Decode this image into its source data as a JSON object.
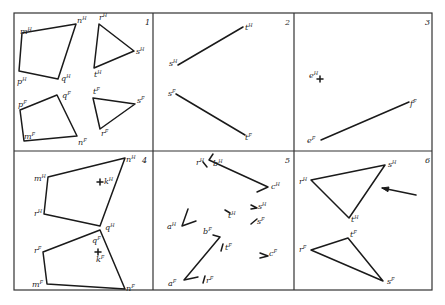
{
  "figure": {
    "grid": {
      "rows": 2,
      "cols": 3
    },
    "panels": [
      {
        "number": "1",
        "polygons": [
          {
            "name": "quad-horizontal",
            "points": [
              [
                22,
                33
              ],
              [
                76,
                24
              ],
              [
                58,
                79
              ],
              [
                19,
                71
              ]
            ],
            "labels": [
              {
                "t": "m",
                "s": "H",
                "x": 20,
                "y": 34
              },
              {
                "t": "n",
                "s": "H",
                "x": 77,
                "y": 23
              },
              {
                "t": "q",
                "s": "H",
                "x": 61,
                "y": 81
              },
              {
                "t": "p",
                "s": "H",
                "x": 17,
                "y": 84
              }
            ]
          },
          {
            "name": "tri-horizontal",
            "points": [
              [
                99,
                24
              ],
              [
                134,
                51
              ],
              [
                94,
                68
              ]
            ],
            "labels": [
              {
                "t": "r",
                "s": "H",
                "x": 99,
                "y": 20
              },
              {
                "t": "s",
                "s": "H",
                "x": 136,
                "y": 54
              },
              {
                "t": "t",
                "s": "H",
                "x": 94,
                "y": 77
              }
            ]
          },
          {
            "name": "quad-frontal",
            "points": [
              [
                20,
                110
              ],
              [
                57,
                95
              ],
              [
                77,
                136
              ],
              [
                24,
                141
              ]
            ],
            "labels": [
              {
                "t": "p",
                "s": "F",
                "x": 18,
                "y": 107
              },
              {
                "t": "q",
                "s": "F",
                "x": 62,
                "y": 98
              },
              {
                "t": "n",
                "s": "F",
                "x": 78,
                "y": 145
              },
              {
                "t": "m",
                "s": "F",
                "x": 24,
                "y": 139
              }
            ]
          },
          {
            "name": "tri-frontal",
            "points": [
              [
                93,
                98
              ],
              [
                135,
                104
              ],
              [
                100,
                129
              ]
            ],
            "labels": [
              {
                "t": "t",
                "s": "F",
                "x": 93,
                "y": 94
              },
              {
                "t": "s",
                "s": "F",
                "x": 137,
                "y": 103
              },
              {
                "t": "r",
                "s": "F",
                "x": 101,
                "y": 136
              }
            ]
          }
        ]
      },
      {
        "number": "2",
        "lines": [
          {
            "name": "line-st-horizontal",
            "from": [
              178,
              65
            ],
            "to": [
              243,
              27
            ],
            "labels": [
              {
                "t": "s",
                "s": "H",
                "x": 169,
                "y": 66
              },
              {
                "t": "t",
                "s": "H",
                "x": 245,
                "y": 30
              }
            ]
          },
          {
            "name": "line-st-frontal",
            "from": [
              176,
              94
            ],
            "to": [
              245,
              135
            ],
            "labels": [
              {
                "t": "s",
                "s": "F",
                "x": 168,
                "y": 96
              },
              {
                "t": "t",
                "s": "F",
                "x": 245,
                "y": 140
              }
            ]
          }
        ]
      },
      {
        "number": "3",
        "points": [
          {
            "name": "point-e-horizontal",
            "at": [
              320,
              79
            ],
            "labels": [
              {
                "t": "e",
                "s": "H",
                "x": 309,
                "y": 78
              }
            ]
          }
        ],
        "lines": [
          {
            "name": "line-ef-frontal",
            "from": [
              321,
              140
            ],
            "to": [
              409,
              102
            ],
            "labels": [
              {
                "t": "e",
                "s": "F",
                "x": 307,
                "y": 143
              },
              {
                "t": "f",
                "s": "F",
                "x": 410,
                "y": 106
              }
            ]
          }
        ]
      },
      {
        "number": "4",
        "polygons": [
          {
            "name": "quad-horizontal",
            "points": [
              [
                48,
                177
              ],
              [
                125,
                158
              ],
              [
                100,
                226
              ],
              [
                44,
                214
              ]
            ],
            "labels": [
              {
                "t": "m",
                "s": "H",
                "x": 34,
                "y": 181
              },
              {
                "t": "n",
                "s": "H",
                "x": 126,
                "y": 162
              },
              {
                "t": "q",
                "s": "H",
                "x": 105,
                "y": 230
              },
              {
                "t": "r",
                "s": "H",
                "x": 34,
                "y": 216
              }
            ]
          },
          {
            "name": "quad-frontal",
            "points": [
              [
                43,
                252
              ],
              [
                100,
                230
              ],
              [
                125,
                289
              ],
              [
                47,
                284
              ]
            ],
            "labels": [
              {
                "t": "r",
                "s": "F",
                "x": 34,
                "y": 253
              },
              {
                "t": "q",
                "s": "F",
                "x": 92,
                "y": 243
              },
              {
                "t": "n",
                "s": "F",
                "x": 126,
                "y": 291
              },
              {
                "t": "m",
                "s": "F",
                "x": 32,
                "y": 287
              }
            ]
          }
        ],
        "points": [
          {
            "name": "point-k-horizontal",
            "at": [
              100,
              182
            ],
            "labels": [
              {
                "t": "k",
                "s": "H",
                "x": 104,
                "y": 184
              }
            ]
          },
          {
            "name": "point-k-frontal",
            "at": [
              98,
              252
            ],
            "labels": [
              {
                "t": "k",
                "s": "F",
                "x": 96,
                "y": 262
              }
            ]
          }
        ]
      },
      {
        "number": "5",
        "polylines": [
          {
            "name": "bc-horizontal",
            "points": [
              [
                213,
                154
              ],
              [
                209,
                160
              ],
              [
                268,
                187
              ],
              [
                257,
                192
              ]
            ],
            "labels": [
              {
                "t": "r",
                "s": "H",
                "x": 196,
                "y": 165
              },
              {
                "t": "b",
                "s": "H",
                "x": 213,
                "y": 166
              },
              {
                "t": "c",
                "s": "H",
                "x": 271,
                "y": 189
              }
            ]
          },
          {
            "name": "ab-frontal",
            "points": [
              [
                213,
                235
              ],
              [
                220,
                237
              ],
              [
                184,
                280
              ],
              [
                198,
                277
              ]
            ],
            "labels": [
              {
                "t": "b",
                "s": "F",
                "x": 203,
                "y": 234
              },
              {
                "t": "a",
                "s": "F",
                "x": 168,
                "y": 286
              }
            ]
          },
          {
            "name": "a-horizontal-tick",
            "points": [
              [
                188,
                209
              ],
              [
                182,
                226
              ],
              [
                196,
                221
              ]
            ],
            "labels": [
              {
                "t": "a",
                "s": "H",
                "x": 167,
                "y": 229
              }
            ]
          }
        ],
        "marks": [
          {
            "name": "r-h-mark",
            "points": [
              [
                203,
                162
              ],
              [
                207,
                167
              ]
            ]
          },
          {
            "name": "t-h-mark",
            "points": [
              [
                225,
                210
              ],
              [
                230,
                213
              ]
            ],
            "labels": [
              {
                "t": "t",
                "s": "H",
                "x": 228,
                "y": 218
              }
            ]
          },
          {
            "name": "s-h-mark",
            "points": [
              [
                251,
                205
              ],
              [
                257,
                208
              ],
              [
                251,
                209
              ]
            ],
            "labels": [
              {
                "t": "s",
                "s": "H",
                "x": 258,
                "y": 209
              }
            ]
          },
          {
            "name": "s-f-mark",
            "points": [
              [
                251,
                224
              ],
              [
                257,
                219
              ]
            ],
            "labels": [
              {
                "t": "s",
                "s": "F",
                "x": 257,
                "y": 224
              }
            ]
          },
          {
            "name": "t-f-mark",
            "points": [
              [
                223,
                244
              ],
              [
                221,
                251
              ]
            ],
            "labels": [
              {
                "t": "t",
                "s": "F",
                "x": 225,
                "y": 250
              }
            ]
          },
          {
            "name": "c-f-mark",
            "points": [
              [
                260,
                253
              ],
              [
                268,
                256
              ],
              [
                260,
                258
              ]
            ],
            "labels": [
              {
                "t": "c",
                "s": "F",
                "x": 269,
                "y": 256
              }
            ]
          },
          {
            "name": "r-f-mark",
            "points": [
              [
                205,
                276
              ],
              [
                203,
                283
              ]
            ],
            "labels": [
              {
                "t": "r",
                "s": "F",
                "x": 206,
                "y": 283
              }
            ]
          }
        ]
      },
      {
        "number": "6",
        "polygons": [
          {
            "name": "tri-horizontal",
            "points": [
              [
                311,
                180
              ],
              [
                385,
                165
              ],
              [
                349,
                218
              ]
            ],
            "labels": [
              {
                "t": "r",
                "s": "H",
                "x": 299,
                "y": 184
              },
              {
                "t": "s",
                "s": "H",
                "x": 388,
                "y": 167
              },
              {
                "t": "t",
                "s": "H",
                "x": 351,
                "y": 222
              }
            ]
          },
          {
            "name": "tri-frontal",
            "points": [
              [
                311,
                250
              ],
              [
                348,
                238
              ],
              [
                383,
                281
              ]
            ],
            "labels": [
              {
                "t": "r",
                "s": "F",
                "x": 299,
                "y": 252
              },
              {
                "t": "t",
                "s": "F",
                "x": 350,
                "y": 237
              },
              {
                "t": "s",
                "s": "F",
                "x": 387,
                "y": 284
              }
            ]
          }
        ],
        "arrows": [
          {
            "name": "view-direction-arrow",
            "from": [
              416,
              195
            ],
            "to": [
              382,
              188
            ]
          }
        ]
      }
    ]
  }
}
